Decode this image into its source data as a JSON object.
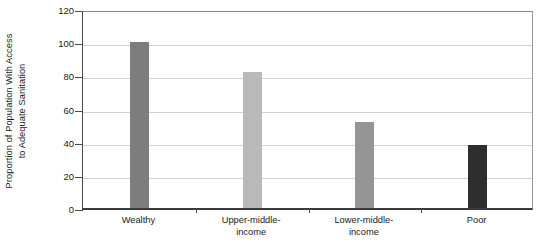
{
  "chart_data": {
    "type": "bar",
    "title": "",
    "xlabel": "",
    "ylabel": "Proportion of Population With Access to Adequate Sanitation",
    "ylabel_lines": [
      "Proportion of Population With Access",
      "to Adequate Sanitation"
    ],
    "categories": [
      "Wealthy",
      "Upper-middle-income",
      "Lower-middle-income",
      "Poor"
    ],
    "category_lines": [
      [
        "Wealthy"
      ],
      [
        "Upper-middle-",
        "income"
      ],
      [
        "Lower-middle-",
        "income"
      ],
      [
        "Poor"
      ]
    ],
    "values": [
      100,
      82,
      52,
      38
    ],
    "bar_colors": [
      "#7d7d7d",
      "#b9b9b9",
      "#959595",
      "#2e2e2e"
    ],
    "ylim": [
      0,
      120
    ],
    "yticks": [
      0,
      20,
      40,
      60,
      80,
      100,
      120
    ],
    "ytick_labels": [
      "0",
      "20",
      "40",
      "60",
      "80",
      "100",
      "120"
    ],
    "grid": true,
    "grid_axis": "y",
    "grid_color": "#d2d2d2",
    "legend": null,
    "legend_position": "none",
    "background_color": "#ffffff",
    "axis_color": "#3a3a3a"
  }
}
